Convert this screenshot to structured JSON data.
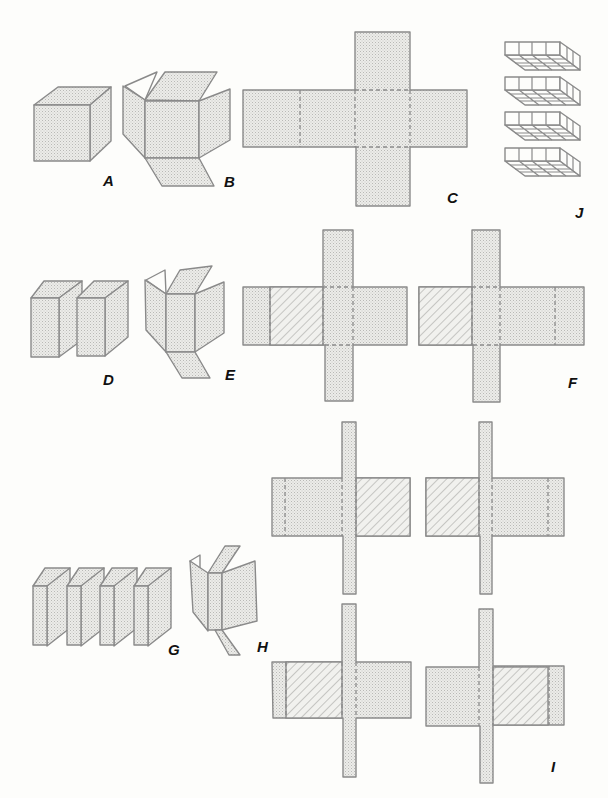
{
  "figure": {
    "labels": {
      "A": "A",
      "B": "B",
      "C": "C",
      "D": "D",
      "E": "E",
      "F": "F",
      "G": "G",
      "H": "H",
      "I": "I",
      "J": "J"
    },
    "descriptions": {
      "A": "closed cube",
      "B": "cube unfolded with flaps",
      "C": "cross-shaped cube net",
      "D": "cube split into two half-slabs",
      "E": "half-slab unfolded",
      "F": "two nets for half-slabs with hatched faces",
      "G": "cube split into four quarter-slabs",
      "H": "quarter-slab unfolded",
      "I": "four nets for quarter-slabs with hatched faces",
      "J": "stack of four layered grid slabs"
    },
    "colors": {
      "stroke": "#8a8a8a",
      "fill": "#e6e6e4",
      "label": "#111111",
      "background": "#fdfdfb"
    }
  }
}
